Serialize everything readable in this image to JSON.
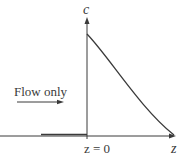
{
  "diagram": {
    "type": "concentration-profile",
    "y_axis_label": "c",
    "x_axis_label": "z",
    "origin_label": "z = 0",
    "flow_label": "Flow only",
    "colors": {
      "line": "#3a3a3a",
      "background": "#ffffff"
    },
    "curve": {
      "description": "Concentration drops from maximum at z=0 and decays toward zero as z increases",
      "start": {
        "z": 0,
        "c": "max"
      },
      "end": {
        "z": "large",
        "c": 0
      }
    },
    "upstream_segment": {
      "description": "Zero concentration for z < 0 (flow only region)"
    }
  }
}
